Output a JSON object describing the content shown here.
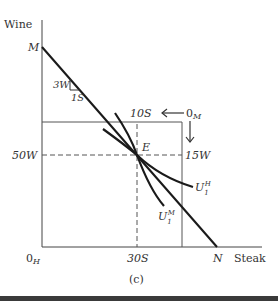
{
  "diagram": {
    "caption": "(c)",
    "axes": {
      "y_label": "Wine",
      "x_label": "Steak",
      "origin_label": "0",
      "origin_sub": "H",
      "second_origin_label": "0",
      "second_origin_sub": "M"
    },
    "points": {
      "M": "M",
      "N": "N",
      "E": "E"
    },
    "slope": {
      "rise": "3W",
      "run": "1S"
    },
    "ticks": {
      "x_E": "30S",
      "y_E": "50W",
      "top_box": "10S",
      "right_box": "15W"
    },
    "curves": {
      "home": {
        "base": "U",
        "sub": "1",
        "sup": "H"
      },
      "foreign": {
        "base": "U",
        "sub": "1",
        "sup": "M"
      }
    },
    "colors": {
      "line": "#1a1a1a",
      "box": "#555555",
      "dash": "#555555",
      "bar": "#3a3a3a"
    }
  }
}
